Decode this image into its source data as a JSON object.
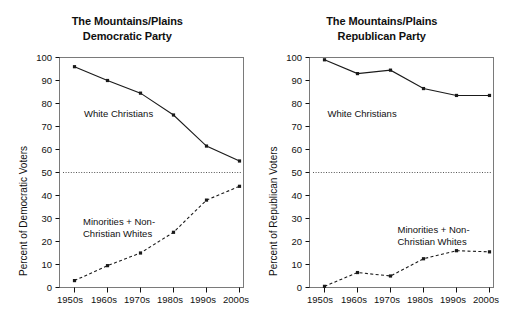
{
  "figure": {
    "background": "#ffffff",
    "line_color": "#1a1a1a",
    "frame_color": "#7a7a7a",
    "reference_line_color": "#555555"
  },
  "panels": [
    {
      "id": "democratic",
      "title_line1": "The Mountains/Plains",
      "title_line2": "Democratic Party",
      "ylabel": "Percent of Democratic Voters",
      "label_white_christians": "White Christians",
      "label_minorities_line1": "Minorities + Non-",
      "label_minorities_line2": "Christian Whites",
      "chart_data": {
        "type": "line",
        "title": "The Mountains/Plains Democratic Party",
        "xlabel": "",
        "ylabel": "Percent of Democratic Voters",
        "categories": [
          "1950s",
          "1960s",
          "1970s",
          "1980s",
          "1990s",
          "2000s"
        ],
        "ylim": [
          0,
          100
        ],
        "yticks": [
          0,
          10,
          20,
          30,
          40,
          50,
          60,
          70,
          80,
          90,
          100
        ],
        "grid": false,
        "legend": "inline-annotations",
        "reference_line": 50,
        "series": [
          {
            "name": "White Christians",
            "style": "solid",
            "marker": "square",
            "values": [
              96.0,
              90.0,
              84.5,
              75.0,
              61.5,
              55.0
            ]
          },
          {
            "name": "Minorities + Non-Christian Whites",
            "style": "dashed",
            "marker": "square",
            "values": [
              3.0,
              9.5,
              15.0,
              24.0,
              38.0,
              44.0
            ]
          }
        ]
      }
    },
    {
      "id": "republican",
      "title_line1": "The Mountains/Plains",
      "title_line2": "Republican Party",
      "ylabel": "Percent of Republican Voters",
      "label_white_christians": "White Christians",
      "label_minorities_line1": "Minorities + Non-",
      "label_minorities_line2": "Christian Whites",
      "chart_data": {
        "type": "line",
        "title": "The Mountains/Plains Republican Party",
        "xlabel": "",
        "ylabel": "Percent of Republican Voters",
        "categories": [
          "1950s",
          "1960s",
          "1970s",
          "1980s",
          "1990s",
          "2000s"
        ],
        "ylim": [
          0,
          100
        ],
        "yticks": [
          0,
          10,
          20,
          30,
          40,
          50,
          60,
          70,
          80,
          90,
          100
        ],
        "grid": false,
        "legend": "inline-annotations",
        "reference_line": 50,
        "series": [
          {
            "name": "White Christians",
            "style": "solid",
            "marker": "square",
            "values": [
              99.0,
              93.0,
              94.5,
              86.5,
              83.5,
              83.5
            ]
          },
          {
            "name": "Minorities + Non-Christian Whites",
            "style": "dashed",
            "marker": "square",
            "values": [
              0.5,
              6.5,
              5.0,
              12.5,
              16.0,
              15.5
            ]
          }
        ]
      }
    }
  ]
}
